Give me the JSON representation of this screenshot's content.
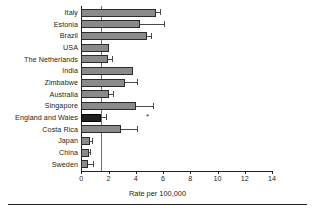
{
  "chart_data": {
    "type": "bar",
    "orientation": "horizontal",
    "title": "",
    "xlabel": "Rate per 100,000",
    "ylabel": "",
    "xlim": [
      0,
      14
    ],
    "xticks": [
      0,
      2,
      4,
      6,
      8,
      10,
      12,
      14
    ],
    "xticklabels": [
      "0",
      "2",
      "4",
      "6",
      "8",
      "10",
      "12",
      "14"
    ],
    "grid": false,
    "legend": "none",
    "reference_line": {
      "value": 1.45,
      "label": "",
      "color": "#6f6f6f"
    },
    "bar_color": "#8a8a8a",
    "highlight_color": "#231f20",
    "highlight_category": "England and Wales",
    "annotations": [
      {
        "symbol": "*",
        "category": "England and Wales",
        "x": 4.75
      }
    ],
    "categories": [
      "Italy",
      "Estonia",
      "Brazil",
      "USA",
      "The Netherlands",
      "India",
      "Zimbabwe",
      "Australia",
      "Singapore",
      "England and Wales",
      "Costa Rica",
      "Japan",
      "China",
      "Sweden"
    ],
    "values": [
      5.45,
      4.3,
      4.8,
      2.0,
      1.95,
      3.8,
      3.2,
      2.0,
      4.05,
      1.45,
      2.9,
      0.65,
      0.6,
      0.5
    ],
    "ci_low": [
      5.45,
      2.85,
      4.8,
      2.0,
      1.95,
      3.8,
      2.45,
      2.0,
      2.8,
      1.45,
      1.85,
      0.65,
      0.6,
      0.4
    ],
    "ci_high": [
      5.8,
      6.1,
      5.1,
      2.0,
      2.25,
      3.8,
      4.1,
      2.3,
      5.25,
      1.8,
      4.1,
      0.75,
      0.65,
      0.85
    ],
    "bars": [
      {
        "label": "Italy",
        "value": 5.45,
        "ci_low": 5.45,
        "ci_high": 5.8,
        "highlight": false
      },
      {
        "label": "Estonia",
        "value": 4.3,
        "ci_low": 2.85,
        "ci_high": 6.1,
        "highlight": false
      },
      {
        "label": "Brazil",
        "value": 4.8,
        "ci_low": 4.8,
        "ci_high": 5.1,
        "highlight": false
      },
      {
        "label": "USA",
        "value": 2.0,
        "ci_low": 2.0,
        "ci_high": 2.0,
        "highlight": false
      },
      {
        "label": "The Netherlands",
        "value": 1.95,
        "ci_low": 1.95,
        "ci_high": 2.25,
        "highlight": false
      },
      {
        "label": "India",
        "value": 3.8,
        "ci_low": 3.8,
        "ci_high": 3.8,
        "highlight": false
      },
      {
        "label": "Zimbabwe",
        "value": 3.2,
        "ci_low": 2.45,
        "ci_high": 4.1,
        "highlight": false
      },
      {
        "label": "Australia",
        "value": 2.0,
        "ci_low": 2.0,
        "ci_high": 2.3,
        "highlight": false
      },
      {
        "label": "Singapore",
        "value": 4.05,
        "ci_low": 2.8,
        "ci_high": 5.25,
        "highlight": false
      },
      {
        "label": "England and Wales",
        "value": 1.45,
        "ci_low": 1.45,
        "ci_high": 1.8,
        "highlight": true
      },
      {
        "label": "Costa Rica",
        "value": 2.9,
        "ci_low": 1.85,
        "ci_high": 4.1,
        "highlight": false
      },
      {
        "label": "Japan",
        "value": 0.65,
        "ci_low": 0.65,
        "ci_high": 0.75,
        "highlight": false
      },
      {
        "label": "China",
        "value": 0.6,
        "ci_low": 0.6,
        "ci_high": 0.65,
        "highlight": false
      },
      {
        "label": "Sweden",
        "value": 0.5,
        "ci_low": 0.4,
        "ci_high": 0.85,
        "highlight": false
      }
    ]
  }
}
